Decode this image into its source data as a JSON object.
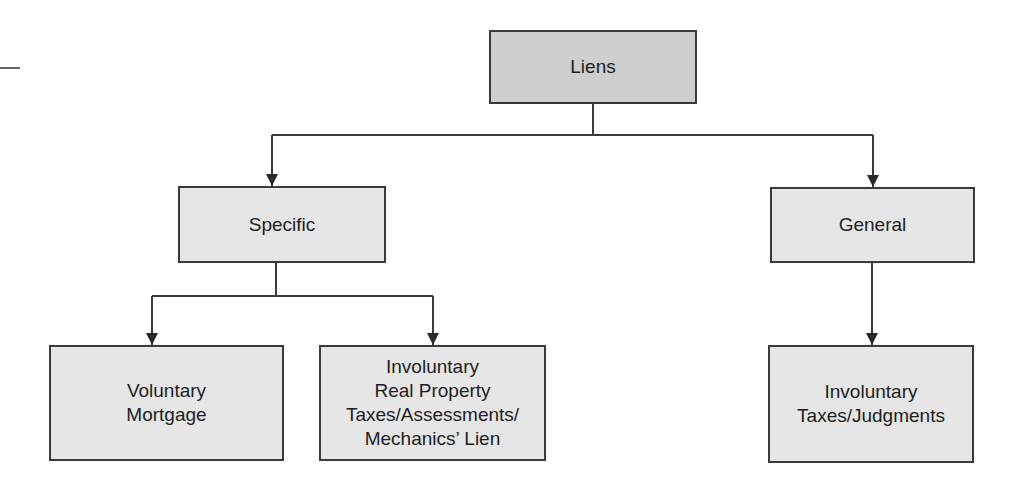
{
  "diagram": {
    "type": "hierarchy",
    "colors": {
      "root_fill": "#cfcfcf",
      "node_fill": "#e6e6e6",
      "border": "#3a3a3a",
      "line": "#3a3a3a"
    },
    "nodes": {
      "root": {
        "label": "Liens"
      },
      "specific": {
        "label": "Specific"
      },
      "general": {
        "label": "General"
      },
      "voluntary": {
        "label": "Voluntary\nMortgage"
      },
      "involuntary_specific": {
        "label": "Involuntary\nReal Property\nTaxes/Assessments/\nMechanics’ Lien"
      },
      "involuntary_general": {
        "label": "Involuntary\nTaxes/Judgments"
      }
    },
    "edges": [
      {
        "from": "Liens",
        "to": "Specific"
      },
      {
        "from": "Liens",
        "to": "General"
      },
      {
        "from": "Specific",
        "to": "Voluntary Mortgage"
      },
      {
        "from": "Specific",
        "to": "Involuntary Real Property Taxes/Assessments/Mechanics’ Lien"
      },
      {
        "from": "General",
        "to": "Involuntary Taxes/Judgments"
      }
    ]
  }
}
